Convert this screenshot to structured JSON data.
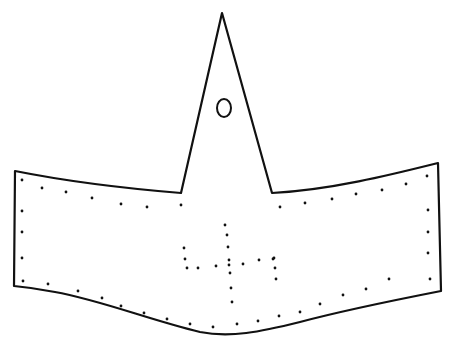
{
  "figure": {
    "colors": {
      "stroke": "#111111",
      "background": "#ffffff"
    },
    "outline_path": "M15,171 C60,180 120,188 181,193 L222,13 L272,193 C330,190 390,175 438,163 L441,291 C395,300 345,310 300,322 C260,332 230,338 200,332 C150,320 100,300 55,292 C40,289 25,287 14,286 Z",
    "hole": {
      "cx": 224,
      "cy": 108,
      "rx": 7,
      "ry": 9
    },
    "stitch_dots": [
      [
        22,
        180
      ],
      [
        42,
        188
      ],
      [
        66,
        192
      ],
      [
        92,
        198
      ],
      [
        121,
        204
      ],
      [
        147,
        207
      ],
      [
        181,
        205
      ],
      [
        22,
        211
      ],
      [
        22,
        232
      ],
      [
        22,
        258
      ],
      [
        23,
        281
      ],
      [
        48,
        284
      ],
      [
        78,
        291
      ],
      [
        102,
        298
      ],
      [
        121,
        306
      ],
      [
        144,
        313
      ],
      [
        167,
        319
      ],
      [
        190,
        324
      ],
      [
        213,
        327
      ],
      [
        237,
        324
      ],
      [
        258,
        321
      ],
      [
        279,
        316
      ],
      [
        300,
        312
      ],
      [
        320,
        304
      ],
      [
        343,
        295
      ],
      [
        366,
        289
      ],
      [
        389,
        279
      ],
      [
        430,
        279
      ],
      [
        428,
        210
      ],
      [
        428,
        232
      ],
      [
        428,
        253
      ],
      [
        427,
        176
      ],
      [
        406,
        184
      ],
      [
        382,
        190
      ],
      [
        356,
        194
      ],
      [
        332,
        199
      ],
      [
        305,
        203
      ],
      [
        280,
        207
      ]
    ],
    "motif_dots": [
      [
        225,
        225
      ],
      [
        227,
        235
      ],
      [
        228,
        247
      ],
      [
        229,
        260
      ],
      [
        229,
        265
      ],
      [
        230,
        273
      ],
      [
        231,
        288
      ],
      [
        232,
        302
      ],
      [
        184,
        248
      ],
      [
        185,
        259
      ],
      [
        187,
        268
      ],
      [
        198,
        268
      ],
      [
        216,
        266
      ],
      [
        243,
        264
      ],
      [
        259,
        260
      ],
      [
        274,
        258
      ],
      [
        275,
        268
      ],
      [
        276,
        279
      ],
      [
        273,
        259
      ]
    ]
  }
}
